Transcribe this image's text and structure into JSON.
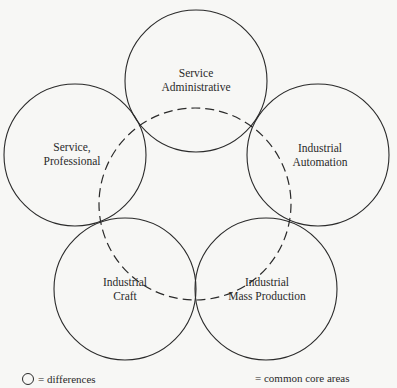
{
  "diagram": {
    "type": "overlapping-circles",
    "colors": {
      "stroke": "#2a2a2a",
      "background": "#f7f7f5"
    },
    "circles": [
      {
        "id": "service-administrative",
        "lines": [
          "Service",
          "Administrative"
        ],
        "cx": 196,
        "cy": 81,
        "r": 71
      },
      {
        "id": "service-professional",
        "lines": [
          "Service,",
          "Professional"
        ],
        "cx": 75,
        "cy": 155,
        "r": 71
      },
      {
        "id": "industrial-automation",
        "lines": [
          "Industrial",
          "Automation"
        ],
        "cx": 318,
        "cy": 155,
        "r": 71
      },
      {
        "id": "industrial-craft",
        "lines": [
          "Industrial",
          "Craft"
        ],
        "cx": 125,
        "cy": 289,
        "r": 71
      },
      {
        "id": "industrial-mass-production",
        "lines": [
          "Industrial",
          "Mass Production"
        ],
        "cx": 266,
        "cy": 289,
        "r": 71
      }
    ],
    "core_circle": {
      "cx": 195,
      "cy": 204,
      "r": 96,
      "style": "dashed"
    }
  },
  "legend": {
    "differences_label": "= differences",
    "common_core_label": "= common core areas"
  }
}
